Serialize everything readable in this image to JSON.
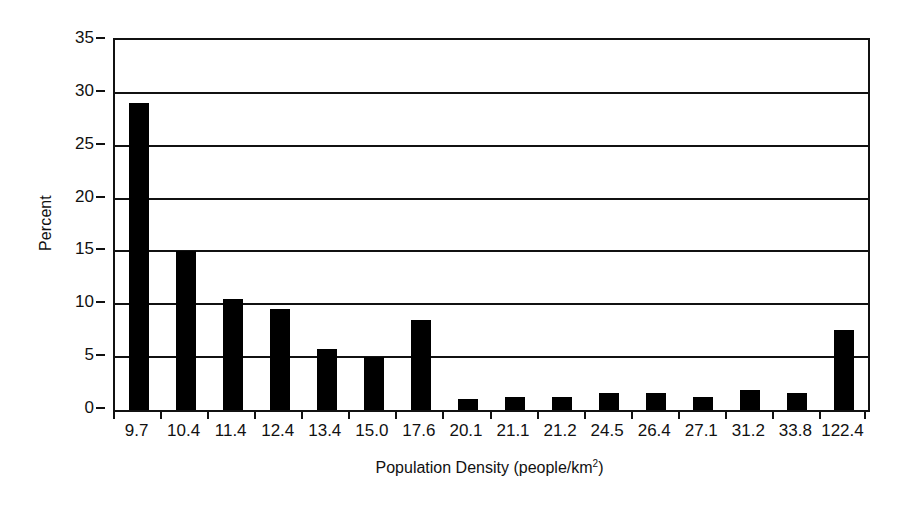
{
  "chart_data": {
    "type": "bar",
    "title": "",
    "xlabel": "Population Density (people/km2)",
    "xlabel_base": "Population Density (people/km",
    "xlabel_sup": "2",
    "xlabel_tail": ")",
    "ylabel": "Percent",
    "ylim": [
      0,
      35
    ],
    "ytick_step": 5,
    "ytick_labels": [
      "0",
      "5",
      "10",
      "15",
      "20",
      "25",
      "30",
      "35"
    ],
    "ytick_values": [
      0,
      5,
      10,
      15,
      20,
      25,
      30,
      35
    ],
    "grid": true,
    "grid_axis": "y",
    "legend": "none",
    "bar_color": "#000000",
    "axis_color": "#111111",
    "background": "#ffffff",
    "categories": [
      "9.7",
      "10.4",
      "11.4",
      "12.4",
      "13.4",
      "15.0",
      "17.6",
      "20.1",
      "21.1",
      "21.2",
      "24.5",
      "26.4",
      "27.1",
      "31.2",
      "33.8",
      "122.4"
    ],
    "values": [
      29.0,
      15.0,
      10.5,
      9.6,
      5.8,
      5.0,
      8.5,
      1.0,
      1.2,
      1.2,
      1.6,
      1.6,
      1.2,
      1.9,
      1.6,
      7.6
    ]
  }
}
